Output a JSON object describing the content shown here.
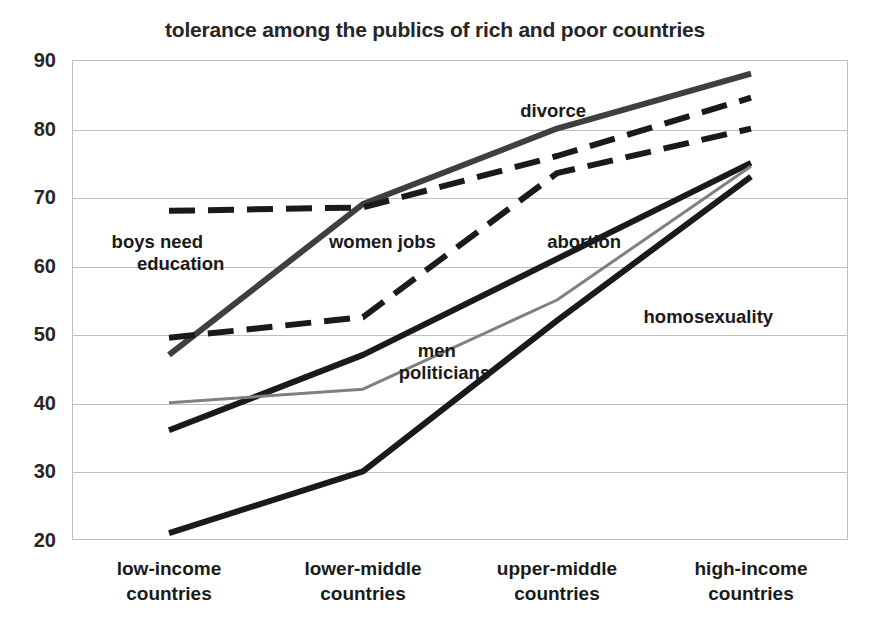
{
  "chart_data": {
    "type": "line",
    "title": "tolerance  among the publics of rich and poor countries",
    "xlabel": "",
    "ylabel": "",
    "ylim": [
      20,
      90
    ],
    "yticks": [
      90,
      80,
      70,
      60,
      50,
      40,
      30,
      20
    ],
    "grid": true,
    "legend_position": "inline-annotations",
    "categories": [
      "low-income countries",
      "lower-middle countries",
      "upper-middle countries",
      "high-income countries"
    ],
    "category_lines": [
      [
        "low-income",
        "countries"
      ],
      [
        "lower-middle",
        "countries"
      ],
      [
        "upper-middle",
        "countries"
      ],
      [
        "high-income",
        "countries"
      ]
    ],
    "series": [
      {
        "name": "divorce",
        "label": "divorce",
        "style": "solid",
        "color": "#3f3f3f",
        "width": 6,
        "values": [
          47,
          69,
          80,
          88
        ]
      },
      {
        "name": "boys need education",
        "label": "boys need\neducation",
        "label_line1": "boys need",
        "label_line2": "education",
        "style": "dashed",
        "color": "#1a1a1a",
        "width": 6,
        "values": [
          68,
          68.5,
          76,
          84.5
        ]
      },
      {
        "name": "women jobs / abortion",
        "label": "abortion",
        "secondary_label": "women jobs",
        "style": "dashed",
        "color": "#1a1a1a",
        "width": 6,
        "values": [
          49.5,
          52.5,
          73.5,
          80
        ]
      },
      {
        "name": "homosexuality",
        "label": "homosexuality",
        "style": "solid",
        "color": "#1a1a1a",
        "width": 6,
        "values": [
          36,
          47,
          61,
          75
        ]
      },
      {
        "name": "men politicians",
        "label": "men\npoliticians",
        "label_line1": "men",
        "label_line2": "politicians",
        "style": "solid",
        "color": "#808080",
        "width": 3,
        "values": [
          40,
          42,
          55,
          74.5
        ]
      },
      {
        "name": "lowest solid series",
        "label": "",
        "style": "solid",
        "color": "#1a1a1a",
        "width": 6,
        "values": [
          21,
          30,
          52,
          73
        ]
      }
    ],
    "annotations": [
      {
        "text": "divorce",
        "x_pct": 62,
        "y_value": 82.5
      },
      {
        "text": "boys need",
        "x_pct": 11,
        "y_value": 63.5
      },
      {
        "text": "education",
        "x_pct": 14,
        "y_value": 60.2
      },
      {
        "text": "women jobs",
        "x_pct": 40,
        "y_value": 63.5
      },
      {
        "text": "abortion",
        "x_pct": 66,
        "y_value": 63.5
      },
      {
        "text": "men",
        "x_pct": 47,
        "y_value": 47.5
      },
      {
        "text": "politicians",
        "x_pct": 48,
        "y_value": 44.3
      },
      {
        "text": "homosexuality",
        "x_pct": 82,
        "y_value": 52.5
      }
    ]
  }
}
